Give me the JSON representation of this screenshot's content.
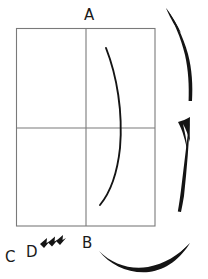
{
  "figure": {
    "background_color": "#ffffff",
    "width": 208,
    "height": 279,
    "labels": {
      "a": "A",
      "b": "B",
      "c": "C",
      "d": "D"
    },
    "colors": {
      "grid_line": "#7a7a7a",
      "stroke_black": "#141414",
      "label_text": "#1a1a1a"
    },
    "shapes": {
      "rectangle": {
        "name": "quadrant-box",
        "x": 16,
        "y": 28,
        "width": 139,
        "height": 198,
        "vertical_divider_x": 86,
        "horizontal_divider_y": 128,
        "line_width": 1
      },
      "inner_curve": {
        "name": "bowed-curve",
        "start": [
          106,
          48
        ],
        "end": [
          100,
          205
        ],
        "max_bulge_x": 122
      },
      "arrows": [
        {
          "name": "top-right-curved-arrow",
          "direction": "up-left",
          "style": "brush-stroke-curved"
        },
        {
          "name": "middle-right-straight-arrow",
          "direction": "up",
          "style": "brush-stroke-straight"
        },
        {
          "name": "bottom-curved-arrow",
          "direction": "right",
          "style": "brush-stroke-curved"
        },
        {
          "name": "small-chevron-marks",
          "direction": "up-right",
          "count": 3,
          "style": "small-arrowheads"
        }
      ]
    }
  }
}
